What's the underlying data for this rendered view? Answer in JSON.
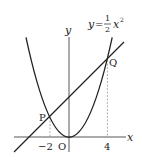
{
  "figure": {
    "equation": {
      "lhs": "y",
      "eq": "=",
      "frac_num": "1",
      "frac_den": "2",
      "var": "x",
      "exp": "2"
    },
    "axes": {
      "x_label": "x",
      "y_label": "y",
      "origin_label": "O"
    },
    "points": [
      {
        "name": "P",
        "x": -2,
        "y": 2
      },
      {
        "name": "Q",
        "x": 4,
        "y": 8
      }
    ],
    "ticks": {
      "neg2": "−2",
      "pos4": "4"
    },
    "curves": {
      "parabola": "y = 1/2 x^2",
      "line": "through P and Q"
    },
    "colors": {
      "stroke": "#222222",
      "dashed": "#999999"
    }
  }
}
